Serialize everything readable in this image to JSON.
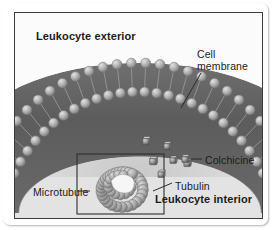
{
  "figure": {
    "style": "grayscale-illustration",
    "colors": {
      "exterior_bg": "#fbfbfb",
      "interior_bg": "#e3e3e3",
      "membrane_core": "#5c5c5c",
      "lipid_head": "#b7b7b7",
      "tubulin": "#b0b0b0",
      "frame": "#3b3b3b",
      "text": "#1b1b1b"
    },
    "labels": {
      "exterior": "Leukocyte exterior",
      "interior": "Leukocyte interior",
      "membrane_line1": "Cell",
      "membrane_line2": "membrane",
      "colchicine": "Colchicine",
      "tubulin": "Tubulin",
      "microtubule": "Microtubule"
    },
    "structures": {
      "bilayer": {
        "name": "phospholipid bilayer",
        "leaflets": 2,
        "heads_per_leaflet": 26,
        "shape": "convex-arc"
      },
      "microtubule": {
        "name": "microtubule cross-section",
        "subunit": "tubulin",
        "subunit_count": 30,
        "lumen": "open-center",
        "callout_box": true
      },
      "colchicine_molecules": {
        "count": 6,
        "glyph": "molecule-cube"
      }
    }
  }
}
